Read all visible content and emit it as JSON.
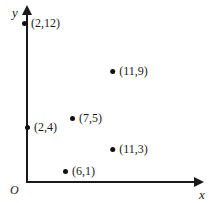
{
  "chart_data": {
    "type": "scatter",
    "title": "",
    "xlabel": "x",
    "ylabel": "y",
    "origin_label": "O",
    "grid": false,
    "legend": null,
    "axes_style": "arrowed-quadrant-one",
    "xlim": [
      0,
      14
    ],
    "ylim": [
      0,
      14
    ],
    "x": [
      2,
      11,
      7,
      2,
      11,
      6
    ],
    "y": [
      12,
      9,
      5,
      4,
      3,
      1
    ],
    "labels": [
      "(2,12)",
      "(11,9)",
      "(7,5)",
      "(2,4)",
      "(11,3)",
      "(6,1)"
    ],
    "points": [
      {
        "label": "(2,12)",
        "x": 2,
        "y": 12,
        "px": 41,
        "py": 23
      },
      {
        "label": "(11,9)",
        "x": 11,
        "y": 9,
        "px": 129,
        "py": 71
      },
      {
        "label": "(7,5)",
        "x": 7,
        "y": 5,
        "px": 86,
        "py": 118
      },
      {
        "label": "(2,4)",
        "x": 2,
        "y": 4,
        "px": 41,
        "py": 127
      },
      {
        "label": "(11,3)",
        "x": 11,
        "y": 3,
        "px": 129,
        "py": 149
      },
      {
        "label": "(6,1)",
        "x": 6,
        "y": 1,
        "px": 79,
        "py": 171
      }
    ],
    "colors": {
      "point": "#111111",
      "axis": "#1a1a1a",
      "background": "#ffffff",
      "text": "#1a1a1a"
    }
  }
}
